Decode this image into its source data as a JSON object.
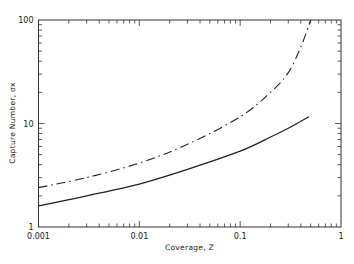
{
  "chart_data": {
    "type": "line",
    "title": "",
    "xlabel": "Coverage, Z",
    "ylabel": "Capture Number, σx",
    "xscale": "log",
    "yscale": "log",
    "xlim": [
      0.001,
      1
    ],
    "ylim": [
      1,
      100
    ],
    "grid": false,
    "legend": null,
    "x_ticks": [
      {
        "value": 0.001,
        "label": "0.001"
      },
      {
        "value": 0.01,
        "label": "0.01"
      },
      {
        "value": 0.1,
        "label": "0.1"
      },
      {
        "value": 1,
        "label": "1"
      }
    ],
    "y_ticks": [
      {
        "value": 1,
        "label": "1"
      },
      {
        "value": 10,
        "label": "10"
      },
      {
        "value": 100,
        "label": "100"
      }
    ],
    "series": [
      {
        "name": "dash-dot curve",
        "style": "dash-dot",
        "x": [
          0.001,
          0.003,
          0.01,
          0.03,
          0.1,
          0.2,
          0.3,
          0.4,
          0.5
        ],
        "y": [
          2.4,
          3.0,
          4.15,
          6.3,
          11.6,
          20,
          31,
          55,
          100
        ]
      },
      {
        "name": "solid curve",
        "style": "solid",
        "x": [
          0.001,
          0.003,
          0.01,
          0.03,
          0.1,
          0.2,
          0.3,
          0.4,
          0.48
        ],
        "y": [
          1.6,
          2.0,
          2.6,
          3.6,
          5.4,
          7.4,
          9.0,
          10.5,
          11.6
        ]
      }
    ]
  }
}
